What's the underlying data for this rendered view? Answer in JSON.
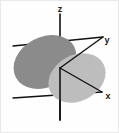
{
  "figure": {
    "width": 119,
    "height": 133,
    "background_color": "#fefefe",
    "border_color": "#e9e9e9"
  },
  "axes": {
    "origin": {
      "x": 60,
      "y": 68
    },
    "items": [
      {
        "id": "z",
        "label": "z",
        "label_x": 60,
        "label_y": 12,
        "line_color": "#111111",
        "line_width": 1.6,
        "start_x": 60,
        "start_y": 14,
        "end_x": 60,
        "end_y": 120
      },
      {
        "id": "y",
        "label": "y",
        "label_x": 107,
        "label_y": 43,
        "line_color": "#111111",
        "line_width": 1.4,
        "start_x": 13,
        "start_y": 46,
        "end_x": 103,
        "end_y": 37
      },
      {
        "id": "x",
        "label": "x",
        "label_x": 108,
        "label_y": 99,
        "line_color": "#111111",
        "line_width": 1.4,
        "start_x": 13,
        "start_y": 98,
        "end_x": 102,
        "end_y": 92
      }
    ]
  },
  "lobes": [
    {
      "id": "lobe-dark",
      "name": "upper-left-lobe",
      "fill_color": "#8b8b8b",
      "center_x": 45,
      "center_y": 62,
      "radius_x": 33,
      "radius_y": 25,
      "rotation_deg": -28
    },
    {
      "id": "lobe-light",
      "name": "lower-right-lobe",
      "fill_color": "#bdbdbd",
      "center_x": 77,
      "center_y": 78,
      "radius_x": 30,
      "radius_y": 23,
      "rotation_deg": -28
    }
  ],
  "chart_data": {
    "type": "scatter",
    "title": "",
    "xlabel": "x",
    "ylabel": "y",
    "zlabel": "z",
    "legend": [],
    "annotations": [
      "z",
      "y",
      "x"
    ],
    "grid": false
  }
}
